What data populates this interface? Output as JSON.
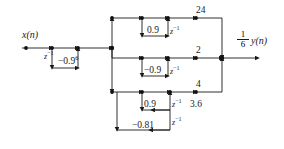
{
  "figure": {
    "type": "signal-flow-graph",
    "input_label": "x(n)",
    "output_label": "y(n)",
    "output_gain_numerator": "1",
    "output_gain_denominator": "6",
    "delay_label": "z",
    "delay_exponent": "−1"
  },
  "branches": {
    "input_delay": "z",
    "input_feedback_gain": "−0.9",
    "input_feedback_exponent": "6",
    "section1_top_gain": "24",
    "section1_feedback_gain": "0.9",
    "section2_top_gain": "2",
    "section2_feedback_gain": "−0.9",
    "section3_top_gain": "4",
    "section3_mid_gain": "3.6",
    "section3_feedback_gain_a": "0.9",
    "section3_feedback_gain_b": "−0.81"
  },
  "labels": [
    {
      "id": "input",
      "text": "x(n)",
      "kind": "signal"
    },
    {
      "id": "input-delay",
      "text": "z",
      "kind": "delay"
    },
    {
      "id": "input-fb",
      "text": "−0.9",
      "kind": "gain"
    },
    {
      "id": "gain-24",
      "text": "24",
      "kind": "gain"
    },
    {
      "id": "gain-09-a",
      "text": "0.9",
      "kind": "gain"
    },
    {
      "id": "gain-2",
      "text": "2",
      "kind": "gain"
    },
    {
      "id": "gain-neg09",
      "text": "−0.9",
      "kind": "gain"
    },
    {
      "id": "gain-4",
      "text": "4",
      "kind": "gain"
    },
    {
      "id": "gain-09-b",
      "text": "0.9",
      "kind": "gain"
    },
    {
      "id": "gain-36",
      "text": "3.6",
      "kind": "gain"
    },
    {
      "id": "gain-neg081",
      "text": "−0.81",
      "kind": "gain"
    },
    {
      "id": "output",
      "text": "y(n)",
      "kind": "signal"
    }
  ],
  "style": {
    "line_color": "#1a1a1a",
    "node_color": "#111111",
    "background": "#ffffff"
  }
}
